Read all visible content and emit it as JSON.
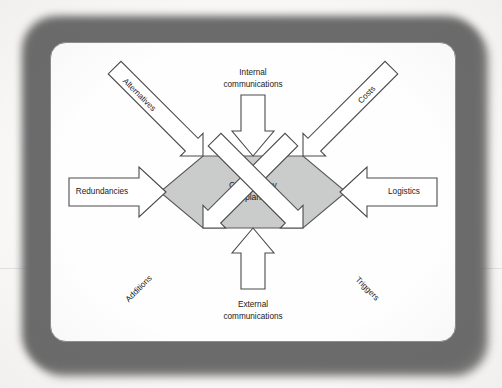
{
  "figure": {
    "center": {
      "line1": "Contingency",
      "line2": "plan"
    },
    "inputs": [
      {
        "id": "alternatives",
        "label": "Alternatives",
        "direction": "top-left",
        "text_placement": "inside-arrow",
        "arrow_points_to": "center"
      },
      {
        "id": "internal-communications",
        "label_line1": "Internal",
        "label_line2": "communications",
        "direction": "top",
        "text_placement": "outside-arrow",
        "arrow_points_to": "center"
      },
      {
        "id": "costs",
        "label": "Costs",
        "direction": "top-right",
        "text_placement": "inside-arrow",
        "arrow_points_to": "center"
      },
      {
        "id": "redundancies",
        "label": "Redundancies",
        "direction": "left",
        "text_placement": "inside-arrow",
        "arrow_points_to": "center"
      },
      {
        "id": "logistics",
        "label": "Logistics",
        "direction": "right",
        "text_placement": "inside-arrow",
        "arrow_points_to": "center"
      },
      {
        "id": "additions",
        "label": "Additions",
        "direction": "bottom-left",
        "text_placement": "inside-arrow",
        "arrow_points_to": "center"
      },
      {
        "id": "external-communications",
        "label_line1": "External",
        "label_line2": "communications",
        "direction": "bottom",
        "text_placement": "outside-arrow",
        "arrow_points_to": "center"
      },
      {
        "id": "triggers",
        "label": "Triggers",
        "direction": "bottom-right",
        "text_placement": "inside-arrow",
        "arrow_points_to": "center"
      }
    ],
    "colors": {
      "hexagon_fill": "#c9ccca",
      "hexagon_stroke": "#5a5a5a",
      "arrow_fill": "#ffffff",
      "arrow_stroke": "#4a4a4a",
      "card_background": "#fefefe",
      "frame": "#6b6b6b",
      "text": "#1a1a1a"
    }
  }
}
